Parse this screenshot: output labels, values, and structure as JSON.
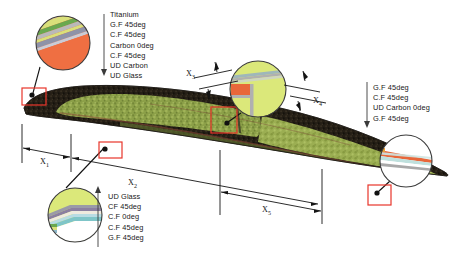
{
  "figure": {
    "name": "wind-turbine-blade-cross-section"
  },
  "callouts": {
    "leading_edge": {
      "name": "leading-edge-callout",
      "stack": [
        "Titanium",
        "G.F 45deg",
        "C.F 45deg",
        "Carbon 0deg",
        "C.F 45deg",
        "UD Carbon",
        "UD Glass"
      ],
      "layer_colors": [
        "#f3f0e2",
        "#d9e07a",
        "#6aa84f",
        "#9b9b9b",
        "#8e93a8",
        "#ef6f42"
      ]
    },
    "lower_surface": {
      "name": "lower-surface-callout",
      "stack": [
        "UD Glass",
        "CF 45deg",
        "C.F 0deg",
        "C.F 45deg",
        "G.F 45deg"
      ],
      "layer_colors": [
        "#dbe87a",
        "#9a9aa8",
        "#8b7fa0",
        "#efeade",
        "#b9dce3",
        "#7fc5c8"
      ]
    },
    "spar_web": {
      "name": "spar-web-callout",
      "layer_colors": [
        "#dbe87a",
        "#e8673a",
        "#b0b0b0",
        "#9fb7ba",
        "#cfd6c0"
      ]
    },
    "trailing_edge": {
      "name": "trailing-edge-callout",
      "layer_colors": [
        "#e8673a",
        "#bfe0dd",
        "#ffffff",
        "#a8a8a8"
      ]
    }
  },
  "right_stack": {
    "name": "trailing-edge-stack-labels",
    "stack": [
      "G.F 45deg",
      "C.F 45deg",
      "UD Carbon 0deg",
      "G.F 45deg"
    ]
  },
  "dimensions": [
    {
      "id": "x1",
      "label": "X",
      "sub": "1",
      "name": "dimension-x1"
    },
    {
      "id": "x2",
      "label": "X",
      "sub": "2",
      "name": "dimension-x2"
    },
    {
      "id": "x3",
      "label": "X",
      "sub": "3",
      "name": "dimension-x3"
    },
    {
      "id": "x4",
      "label": "X",
      "sub": "4",
      "name": "dimension-x4"
    },
    {
      "id": "x5",
      "label": "X",
      "sub": "5",
      "name": "dimension-x5"
    }
  ],
  "colors": {
    "marker_box": "#e8352a",
    "blade_dark": "#221c14",
    "blade_core": "#7f933f",
    "blade_core_light": "#9fb24e",
    "leader": "#111111"
  }
}
